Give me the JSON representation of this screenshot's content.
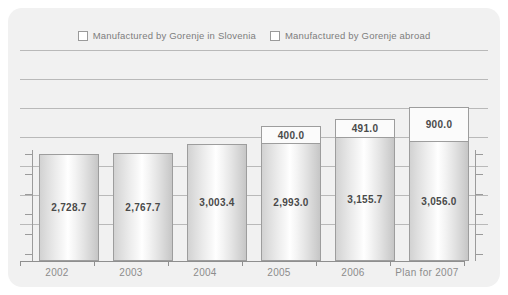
{
  "chart_data": {
    "type": "bar",
    "subtype": "stacked-column",
    "title": "",
    "xlabel": "",
    "ylabel": "",
    "categories": [
      "2002",
      "2003",
      "2004",
      "2005",
      "2006",
      "Plan for 2007"
    ],
    "series": [
      {
        "name": "Manufactured by Gorenje in Slovenia",
        "values": [
          2728.7,
          2767.7,
          3003.4,
          2993.0,
          3155.7,
          3056.0
        ],
        "labels": [
          "2,728.7",
          "2,767.7",
          "3,003.4",
          "2,993.0",
          "3,155.7",
          "3,056.0"
        ],
        "color": "#e3e3e3"
      },
      {
        "name": "Manufactured by Gorenje abroad",
        "values": [
          null,
          null,
          null,
          400.0,
          491.0,
          900.0
        ],
        "labels": [
          "",
          "",
          "",
          "400.0",
          "491.0",
          "900.0"
        ],
        "color": "#fbfbfb"
      }
    ],
    "totals": [
      2728.7,
      2767.7,
      3003.4,
      3393.0,
      3646.7,
      3956.0
    ],
    "ylim": [
      0,
      5400
    ],
    "grid": true,
    "legend_position": "top-center"
  },
  "legend": {
    "items": [
      {
        "label": "Manufactured by Gorenje in Slovenia",
        "swatch": "#ffffff"
      },
      {
        "label": "Manufactured by Gorenje abroad",
        "swatch": "#ffffff"
      }
    ]
  },
  "colors": {
    "panel_background": "#f1f1f1",
    "gridline": "#b9b9b9",
    "axis": "#8f8f8f",
    "label_text": "#8c8c8c",
    "value_text": "#4a4a4a",
    "bar_border": "#9d9d9d"
  }
}
